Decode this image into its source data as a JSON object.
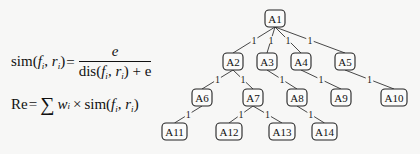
{
  "formulas": {
    "sim": {
      "lhs_fn": "sim(",
      "lhs_f": "f",
      "lhs_r": "r",
      "sub": "i",
      "eq": "=",
      "numerator": "e",
      "den_fn": "dis(",
      "den_tail": "+ e"
    },
    "re": {
      "lhs": "Re",
      "eq": "=",
      "sum": "∑",
      "w": "w",
      "times": "×",
      "fn": "sim(",
      "f": "f",
      "r": "r",
      "sub": "i"
    }
  },
  "tree": {
    "nodes": [
      {
        "id": "A1",
        "label": "A1",
        "x": 265,
        "y": 10,
        "w": 20,
        "h": 17
      },
      {
        "id": "A2",
        "label": "A2",
        "x": 223,
        "y": 53,
        "w": 20,
        "h": 17
      },
      {
        "id": "A3",
        "label": "A3",
        "x": 257,
        "y": 53,
        "w": 20,
        "h": 17
      },
      {
        "id": "A4",
        "label": "A4",
        "x": 291,
        "y": 53,
        "w": 20,
        "h": 17
      },
      {
        "id": "A5",
        "label": "A5",
        "x": 335,
        "y": 53,
        "w": 20,
        "h": 17
      },
      {
        "id": "A6",
        "label": "A6",
        "x": 192,
        "y": 89,
        "w": 20,
        "h": 17
      },
      {
        "id": "A7",
        "label": "A7",
        "x": 243,
        "y": 89,
        "w": 20,
        "h": 17
      },
      {
        "id": "A8",
        "label": "A8",
        "x": 287,
        "y": 89,
        "w": 20,
        "h": 17
      },
      {
        "id": "A9",
        "label": "A9",
        "x": 331,
        "y": 89,
        "w": 20,
        "h": 17
      },
      {
        "id": "A10",
        "label": "A10",
        "x": 381,
        "y": 89,
        "w": 26,
        "h": 17
      },
      {
        "id": "A11",
        "label": "A11",
        "x": 162,
        "y": 123,
        "w": 25,
        "h": 17
      },
      {
        "id": "A12",
        "label": "A12",
        "x": 216,
        "y": 123,
        "w": 26,
        "h": 17
      },
      {
        "id": "A13",
        "label": "A13",
        "x": 269,
        "y": 123,
        "w": 26,
        "h": 17
      },
      {
        "id": "A14",
        "label": "A14",
        "x": 312,
        "y": 123,
        "w": 25,
        "h": 17
      }
    ],
    "edges": [
      {
        "from": "A1",
        "to": "A2",
        "label": "1"
      },
      {
        "from": "A1",
        "to": "A3",
        "label": "1"
      },
      {
        "from": "A1",
        "to": "A4",
        "label": "1"
      },
      {
        "from": "A1",
        "to": "A5",
        "label": "1"
      },
      {
        "from": "A2",
        "to": "A6",
        "label": "1"
      },
      {
        "from": "A2",
        "to": "A7",
        "label": "1"
      },
      {
        "from": "A3",
        "to": "A8",
        "label": "1"
      },
      {
        "from": "A4",
        "to": "A9",
        "label": "1"
      },
      {
        "from": "A5",
        "to": "A10",
        "label": "1"
      },
      {
        "from": "A6",
        "to": "A11",
        "label": "1"
      },
      {
        "from": "A7",
        "to": "A12",
        "label": "1"
      },
      {
        "from": "A7",
        "to": "A13",
        "label": "1"
      },
      {
        "from": "A8",
        "to": "A14",
        "label": "1"
      }
    ]
  }
}
